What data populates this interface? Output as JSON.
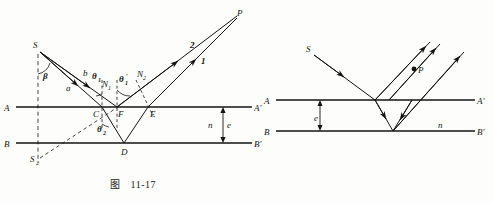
{
  "page": {
    "background_color": "#fdfdfb",
    "ink_color": "#131313"
  },
  "figures": [
    {
      "id": "fig-11-17",
      "caption_prefix": "图",
      "caption_number": "11-17",
      "description": "Thin film interference: ray from S refracts at C, reflects at D on lower surface B-B', emerges at E; rays 1 and 2 converge at P",
      "labels": {
        "source": "S",
        "image_source": "S",
        "image_source_sub": "2",
        "point_p": "P",
        "point_c": "C",
        "point_f": "F",
        "point_e": "E",
        "point_d": "D",
        "surface_a_left": "A",
        "surface_a_right": "A'",
        "surface_b_left": "B",
        "surface_b_right": "B'",
        "angle_beta": "β",
        "segment_a": "a",
        "segment_b": "b",
        "angle_theta1": "θ",
        "angle_theta1_sub": "1",
        "angle_theta1_prime": "θ",
        "angle_theta1_prime_sub": "1",
        "angle_theta1_prime_mark": "′",
        "angle_theta2": "θ",
        "angle_theta2_sub": "2",
        "normal_n1": "N",
        "normal_n1_sub": "1",
        "normal_n2": "N",
        "normal_n2_sub": "2",
        "ray_1": "1",
        "ray_2": "2",
        "index_n": "n",
        "thickness_e": "e"
      }
    },
    {
      "id": "fig-11-18",
      "caption_prefix": "图",
      "caption_number": "11-18",
      "description": "Equal-inclination style film diagram: ray from S enters film, reflects inside, emerges as parallel rays meeting at P",
      "labels": {
        "source": "S",
        "point_p": "P",
        "surface_a_left": "A",
        "surface_a_right": "A'",
        "surface_b_left": "B",
        "surface_b_right": "B'",
        "thickness_e": "e",
        "index_n": "n"
      }
    }
  ]
}
